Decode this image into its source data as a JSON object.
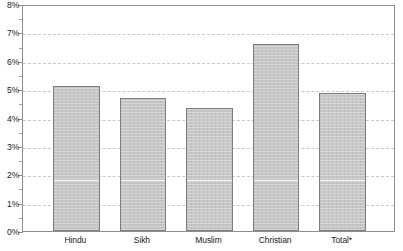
{
  "chart_data": {
    "type": "bar",
    "title": "",
    "subtitle": "",
    "xlabel": "",
    "ylabel": "",
    "categories": [
      "Hindu",
      "Sikh",
      "Muslim",
      "Christian",
      "Total*"
    ],
    "values": [
      5.1,
      4.7,
      4.35,
      6.6,
      4.85
    ],
    "value_labels": [
      "5.1%",
      "4.7%",
      "4.4%",
      "6.6%",
      "4.9%"
    ],
    "ylim": [
      0,
      8
    ],
    "y_tick_values": [
      0,
      1,
      2,
      3,
      4,
      5,
      6,
      7,
      8
    ],
    "y_tick_labels": [
      "0%",
      "1%",
      "2%",
      "3%",
      "4%",
      "5%",
      "6%",
      "7%",
      "8%"
    ],
    "y_minor_tick_step": 0.5,
    "grid": true,
    "grid_axis": "y",
    "grid_style": "dashed",
    "legend": false,
    "legend_position": "none",
    "annotations": [],
    "series": [
      {
        "name": "Percentage",
        "values": [
          5.1,
          4.7,
          4.35,
          6.6,
          4.85
        ]
      }
    ]
  },
  "style": {
    "bar_fill": "#c6c6c6",
    "bar_border": "#7d7d7d",
    "grid_color": "#c9c9c9",
    "axis_color": "#8f8f8f",
    "text_color": "#1a1a1a",
    "background": "#ffffff"
  }
}
